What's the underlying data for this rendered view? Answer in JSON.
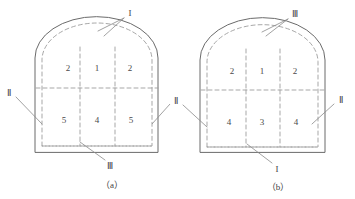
{
  "figure": {
    "type": "engineering-cross-section-diagram",
    "colors": {
      "outline": "#6b6b6b",
      "dashed": "#9a9a9a",
      "text": "#3d3d3d",
      "background": "#ffffff"
    },
    "diagrams": [
      {
        "caption": "（a）",
        "cells": [
          {
            "label": "2",
            "x": 68,
            "y": 68
          },
          {
            "label": "1",
            "x": 97,
            "y": 68
          },
          {
            "label": "2",
            "x": 130,
            "y": 68
          },
          {
            "label": "5",
            "x": 64,
            "y": 120
          },
          {
            "label": "4",
            "x": 97,
            "y": 120
          },
          {
            "label": "5",
            "x": 131,
            "y": 120
          }
        ],
        "annotations": [
          {
            "label": "I",
            "x": 130,
            "y": 13
          },
          {
            "label": "Ⅱ",
            "x": 9,
            "y": 93
          },
          {
            "label": "Ⅲ",
            "x": 110,
            "y": 166
          }
        ]
      },
      {
        "caption": "（b）",
        "cells": [
          {
            "label": "2",
            "x": 232,
            "y": 71
          },
          {
            "label": "1",
            "x": 262,
            "y": 71
          },
          {
            "label": "2",
            "x": 295,
            "y": 71
          },
          {
            "label": "4",
            "x": 229,
            "y": 122
          },
          {
            "label": "3",
            "x": 262,
            "y": 122
          },
          {
            "label": "4",
            "x": 296,
            "y": 122
          }
        ],
        "annotations": [
          {
            "label": "Ⅲ",
            "x": 295,
            "y": 14
          },
          {
            "label": "Ⅱ",
            "x": 176,
            "y": 101
          },
          {
            "label": "Ⅱ",
            "x": 341,
            "y": 100
          },
          {
            "label": "I",
            "x": 277,
            "y": 169
          }
        ]
      }
    ],
    "captions": [
      {
        "label": "（a）",
        "x": 112,
        "y": 184
      },
      {
        "label": "（b）",
        "x": 278,
        "y": 186
      }
    ]
  }
}
